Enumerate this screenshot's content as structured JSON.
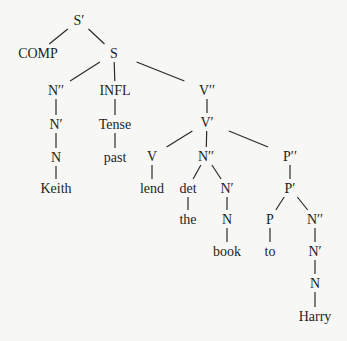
{
  "diagram": {
    "type": "syntax-tree",
    "background": "#f7f7f5",
    "line_color": "#2a2a2a",
    "nodes": [
      {
        "id": "sbar",
        "label": "S′",
        "x": 79,
        "y": 20
      },
      {
        "id": "comp",
        "label": "COMP",
        "x": 38,
        "y": 53
      },
      {
        "id": "s",
        "label": "S",
        "x": 114,
        "y": 53
      },
      {
        "id": "np",
        "label": "N′′",
        "x": 56,
        "y": 90
      },
      {
        "id": "infl",
        "label": "INFL",
        "x": 115,
        "y": 90
      },
      {
        "id": "vp",
        "label": "V′′",
        "x": 207,
        "y": 90
      },
      {
        "id": "nbar1",
        "label": "N′",
        "x": 56,
        "y": 124
      },
      {
        "id": "tense",
        "label": "Tense",
        "x": 115,
        "y": 124
      },
      {
        "id": "vbar",
        "label": "V′",
        "x": 207,
        "y": 122
      },
      {
        "id": "n1",
        "label": "N",
        "x": 56,
        "y": 157
      },
      {
        "id": "past",
        "label": "past",
        "x": 115,
        "y": 157
      },
      {
        "id": "v",
        "label": "V",
        "x": 152,
        "y": 156
      },
      {
        "id": "np2",
        "label": "N′′",
        "x": 206,
        "y": 156
      },
      {
        "id": "pp",
        "label": "P′′",
        "x": 290,
        "y": 156
      },
      {
        "id": "keith",
        "label": "Keith",
        "x": 56,
        "y": 188
      },
      {
        "id": "lend",
        "label": "lend",
        "x": 152,
        "y": 188
      },
      {
        "id": "det",
        "label": "det",
        "x": 188,
        "y": 188
      },
      {
        "id": "nbar2",
        "label": "N′",
        "x": 227,
        "y": 188
      },
      {
        "id": "pbar",
        "label": "P′",
        "x": 290,
        "y": 188
      },
      {
        "id": "the",
        "label": "the",
        "x": 188,
        "y": 219
      },
      {
        "id": "n2",
        "label": "N",
        "x": 227,
        "y": 219
      },
      {
        "id": "p",
        "label": "P",
        "x": 270,
        "y": 219
      },
      {
        "id": "np3",
        "label": "N′′",
        "x": 315,
        "y": 219
      },
      {
        "id": "book",
        "label": "book",
        "x": 227,
        "y": 251
      },
      {
        "id": "to",
        "label": "to",
        "x": 270,
        "y": 251
      },
      {
        "id": "nbar3",
        "label": "N′",
        "x": 315,
        "y": 251
      },
      {
        "id": "n3",
        "label": "N",
        "x": 315,
        "y": 283
      },
      {
        "id": "harry",
        "label": "Harry",
        "x": 315,
        "y": 316
      }
    ],
    "edges": [
      [
        "sbar",
        "comp"
      ],
      [
        "sbar",
        "s"
      ],
      [
        "s",
        "np"
      ],
      [
        "s",
        "infl"
      ],
      [
        "s",
        "vp"
      ],
      [
        "np",
        "nbar1"
      ],
      [
        "nbar1",
        "n1"
      ],
      [
        "n1",
        "keith"
      ],
      [
        "infl",
        "tense"
      ],
      [
        "tense",
        "past"
      ],
      [
        "vp",
        "vbar"
      ],
      [
        "vbar",
        "v"
      ],
      [
        "vbar",
        "np2"
      ],
      [
        "vbar",
        "pp"
      ],
      [
        "v",
        "lend"
      ],
      [
        "np2",
        "det"
      ],
      [
        "np2",
        "nbar2"
      ],
      [
        "det",
        "the"
      ],
      [
        "nbar2",
        "n2"
      ],
      [
        "n2",
        "book"
      ],
      [
        "pp",
        "pbar"
      ],
      [
        "pbar",
        "p"
      ],
      [
        "pbar",
        "np3"
      ],
      [
        "p",
        "to"
      ],
      [
        "np3",
        "nbar3"
      ],
      [
        "nbar3",
        "n3"
      ],
      [
        "n3",
        "harry"
      ]
    ]
  }
}
